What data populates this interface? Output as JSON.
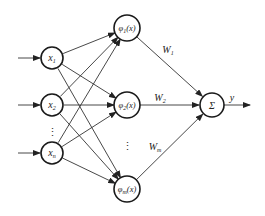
{
  "diagram": {
    "type": "rbf-neural-network",
    "inputs": [
      {
        "id": "x1",
        "base": "x",
        "sub": "1",
        "cx": 52,
        "cy": 58
      },
      {
        "id": "x2",
        "base": "x",
        "sub": "2",
        "cx": 52,
        "cy": 105
      },
      {
        "id": "xn",
        "base": "x",
        "sub": "n",
        "cx": 52,
        "cy": 153
      }
    ],
    "input_ellipsis": {
      "text": "⋮",
      "x": 52,
      "y": 132
    },
    "hidden": [
      {
        "id": "phi1",
        "base": "φ",
        "sub": "1",
        "arg": "(x)",
        "cx": 127,
        "cy": 28
      },
      {
        "id": "phi2",
        "base": "φ",
        "sub": "2",
        "arg": "(x)",
        "cx": 127,
        "cy": 105
      },
      {
        "id": "phim",
        "base": "φ",
        "sub": "m",
        "arg": "(x)",
        "cx": 127,
        "cy": 189
      }
    ],
    "hidden_ellipsis": {
      "text": "⋮",
      "x": 127,
      "y": 146
    },
    "output_node": {
      "id": "sum",
      "label": "Σ",
      "cx": 212,
      "cy": 105
    },
    "weights": [
      {
        "base": "W",
        "sub": "1",
        "x": 168,
        "y": 53
      },
      {
        "base": "W",
        "sub": "2",
        "x": 160,
        "y": 101
      },
      {
        "base": "W",
        "sub": "m",
        "x": 155,
        "y": 150
      }
    ],
    "output_label": {
      "text": "y",
      "x": 232,
      "y": 101
    },
    "node_radius": 12
  }
}
